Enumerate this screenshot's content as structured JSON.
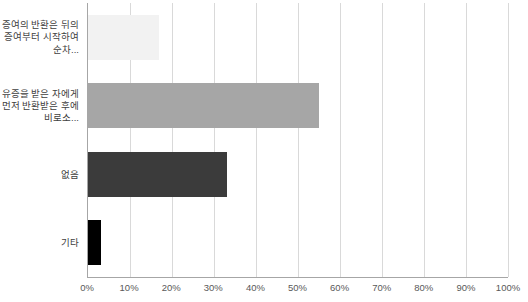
{
  "chart_data": {
    "type": "bar",
    "orientation": "horizontal",
    "title": "",
    "xlabel": "",
    "ylabel": "",
    "categories": [
      "증여의 반환은 뒤의 증여부터 시작하여 순차...",
      "유증을 받은 자에게 먼저 반환받은 후에 비로소...",
      "없음",
      "기타"
    ],
    "values": [
      17,
      55,
      33,
      3
    ],
    "bar_colors": [
      "#f2f2f2",
      "#a6a6a6",
      "#3b3b3b",
      "#000000"
    ],
    "x_ticks": [
      "0%",
      "10%",
      "20%",
      "30%",
      "40%",
      "50%",
      "60%",
      "70%",
      "80%",
      "90%",
      "100%"
    ],
    "x_tick_values": [
      0,
      10,
      20,
      30,
      40,
      50,
      60,
      70,
      80,
      90,
      100
    ],
    "xlim": [
      0,
      100
    ],
    "grid": "vertical",
    "legend": "none"
  },
  "colors": {
    "background": "#ffffff",
    "gridline": "#d9d9d9",
    "axis_line": "#a6a6a6",
    "category_label_text": "#404040",
    "tick_label_text": "#595959"
  }
}
